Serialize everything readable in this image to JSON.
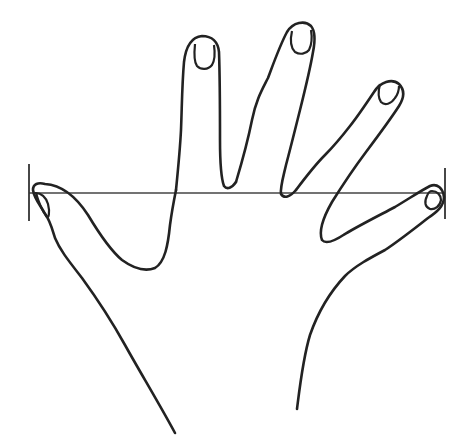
{
  "figure": {
    "type": "line-drawing",
    "colors": {
      "background": "#ffffff",
      "stroke": "#222222",
      "measure_line": "#444444"
    },
    "measurement": {
      "name": "hand span",
      "from": "thumb tip",
      "to": "little finger tip",
      "line_y": 193,
      "left_x": 29,
      "right_x": 445
    },
    "parts": [
      "thumb",
      "index finger",
      "middle finger",
      "ring finger",
      "little finger",
      "palm",
      "wrist"
    ]
  }
}
